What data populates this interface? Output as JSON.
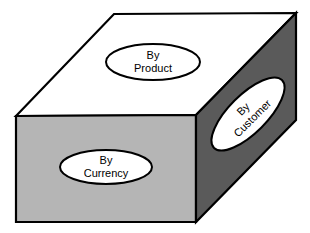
{
  "diagram": {
    "type": "3d-box-dimension-diagram",
    "title": "",
    "colors": {
      "top_face": "#ffffff",
      "front_face": "#b5b5b5",
      "right_face": "#5a5a5a",
      "outline": "#000000",
      "ellipse_fill": "#ffffff",
      "ellipse_stroke": "#000000",
      "text": "#000000",
      "background": "#ffffff"
    },
    "faces": [
      {
        "id": "top",
        "name": "top-face",
        "fill": "#ffffff",
        "points": "16,116 114,14 296,13 196,115"
      },
      {
        "id": "front",
        "name": "front-face",
        "fill": "#b5b5b5",
        "points": "16,116 196,115 196,222 16,222"
      },
      {
        "id": "right",
        "name": "right-face",
        "fill": "#5a5a5a",
        "points": "196,115 296,13 296,120 196,222"
      }
    ],
    "labels": [
      {
        "id": "by-product",
        "face": "top",
        "line1": "By",
        "line2": "Product",
        "cx": 153,
        "cy": 62,
        "rx": 47,
        "ry": 18,
        "rotate": 0
      },
      {
        "id": "by-currency",
        "face": "front",
        "line1": "By",
        "line2": "Currency",
        "cx": 106,
        "cy": 167,
        "rx": 46,
        "ry": 17,
        "rotate": 0
      },
      {
        "id": "by-customer",
        "face": "right",
        "line1": "By",
        "line2": "Customer",
        "cx": 248,
        "cy": 114,
        "rx": 48,
        "ry": 19,
        "rotate": -45
      }
    ]
  }
}
